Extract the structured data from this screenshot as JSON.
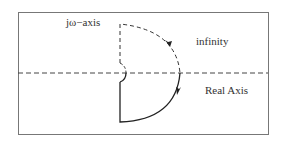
{
  "diagram": {
    "labels": {
      "jw_axis": "jω−axis",
      "infinity": "infinity",
      "real_axis": "Real Axis"
    },
    "colors": {
      "frame": "#777777",
      "axis": "#444444",
      "contour": "#222222",
      "text": "#333333",
      "background": "#ffffff"
    },
    "elements": [
      {
        "type": "frame",
        "description": "rectangular border"
      },
      {
        "type": "real-axis",
        "style": "dashed",
        "description": "horizontal dashed line"
      },
      {
        "type": "contour-upper",
        "style": "dashed",
        "description": "upper half of contour along jω-axis and infinite arc"
      },
      {
        "type": "contour-lower",
        "style": "solid",
        "description": "lower half of contour along jω-axis and infinite arc"
      },
      {
        "type": "indentation",
        "description": "small semicircle around origin"
      },
      {
        "type": "arrow",
        "position": "upper arc",
        "direction": "clockwise"
      },
      {
        "type": "arrow",
        "position": "lower arc",
        "direction": "clockwise"
      }
    ]
  }
}
